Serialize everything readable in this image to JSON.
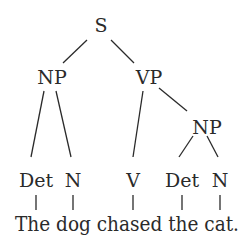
{
  "diagram": {
    "type": "syntax-tree",
    "nodes": {
      "s": {
        "label": "S",
        "x": 101,
        "y": 32
      },
      "np1": {
        "label": "NP",
        "x": 52,
        "y": 84
      },
      "vp": {
        "label": "VP",
        "x": 149,
        "y": 84
      },
      "np2": {
        "label": "NP",
        "x": 207,
        "y": 134
      },
      "det1": {
        "label": "Det",
        "x": 36,
        "y": 187
      },
      "n1": {
        "label": "N",
        "x": 73,
        "y": 187
      },
      "v": {
        "label": "V",
        "x": 133,
        "y": 187
      },
      "det2": {
        "label": "Det",
        "x": 182,
        "y": 187
      },
      "n2": {
        "label": "N",
        "x": 220,
        "y": 187
      }
    },
    "edges": [
      {
        "from": "S",
        "to": "NP",
        "x1": 87,
        "y1": 40,
        "x2": 63,
        "y2": 63
      },
      {
        "from": "S",
        "to": "VP",
        "x1": 111,
        "y1": 40,
        "x2": 134,
        "y2": 63
      },
      {
        "from": "NP",
        "to": "Det",
        "x1": 44,
        "y1": 91,
        "x2": 31,
        "y2": 157
      },
      {
        "from": "NP",
        "to": "N",
        "x1": 56,
        "y1": 91,
        "x2": 71,
        "y2": 157
      },
      {
        "from": "VP",
        "to": "V",
        "x1": 143,
        "y1": 91,
        "x2": 133,
        "y2": 157
      },
      {
        "from": "VP",
        "to": "NP",
        "x1": 159,
        "y1": 88,
        "x2": 187,
        "y2": 111
      },
      {
        "from": "NP",
        "to": "Det",
        "x1": 193,
        "y1": 136,
        "x2": 179,
        "y2": 157
      },
      {
        "from": "NP",
        "to": "N",
        "x1": 207,
        "y1": 136,
        "x2": 218,
        "y2": 157
      }
    ],
    "ticks": [
      {
        "x": 36,
        "y1": 195,
        "y2": 210
      },
      {
        "x": 73,
        "y1": 195,
        "y2": 210
      },
      {
        "x": 133,
        "y1": 195,
        "y2": 210
      },
      {
        "x": 182,
        "y1": 195,
        "y2": 210
      },
      {
        "x": 220,
        "y1": 195,
        "y2": 210
      }
    ],
    "sentence": "The dog chased the cat.",
    "words": [
      "The",
      "dog",
      "chased",
      "the",
      "cat."
    ],
    "colors": {
      "ink": "#2a2a2a",
      "background": "#ffffff"
    }
  }
}
